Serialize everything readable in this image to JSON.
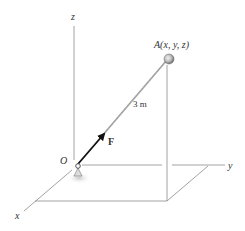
{
  "diagram": {
    "axes": {
      "z_label": "z",
      "y_label": "y",
      "x_label": "x"
    },
    "origin_label": "O",
    "point_label": "A(x, y, z)",
    "length_label": "3 m",
    "force_label": "F",
    "colors": {
      "axis": "#8a8a8a",
      "rod": "#9a9a9a",
      "force": "#111111",
      "shadow": "#cfcfcf"
    }
  }
}
